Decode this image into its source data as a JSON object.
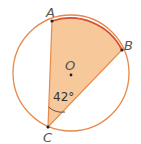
{
  "diagram": {
    "points": {
      "A": "A",
      "B": "B",
      "C": "C",
      "O": "O"
    },
    "angle_label": "42°",
    "colors": {
      "circle": "#e8884a",
      "arc": "#d9513a",
      "fill": "#f7c99a",
      "point": "#222222"
    }
  }
}
